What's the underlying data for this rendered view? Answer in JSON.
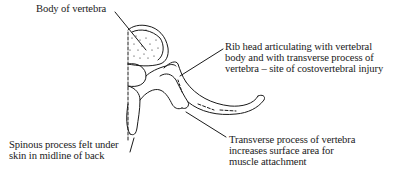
{
  "diagram": {
    "labels": {
      "body": {
        "lines": [
          "Body of vertebra"
        ]
      },
      "rib_head": {
        "lines": [
          "Rib head articulating with vertebral",
          "body and with transverse process of",
          "vertebra – site of costovertebral injury"
        ]
      },
      "spinous": {
        "lines": [
          "Spinous process felt under",
          "skin in midline of back"
        ]
      },
      "transverse": {
        "lines": [
          "Transverse process of vertebra",
          "increases surface area for",
          "muscle attachment"
        ]
      }
    },
    "colors": {
      "ink": "#1a1a1a",
      "background": "#ffffff"
    }
  }
}
